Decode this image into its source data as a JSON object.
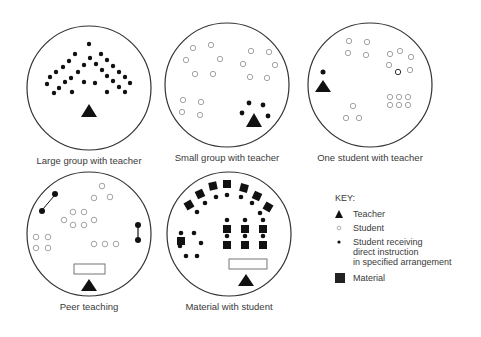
{
  "panels": [
    {
      "id": "large-group",
      "caption": "Large group with teacher"
    },
    {
      "id": "small-group",
      "caption": "Small group with teacher"
    },
    {
      "id": "one-student",
      "caption": "One student with teacher"
    },
    {
      "id": "peer-teaching",
      "caption": "Peer teaching"
    },
    {
      "id": "material",
      "caption": "Material with student"
    }
  ],
  "key": {
    "title": "KEY:",
    "items": [
      {
        "symbol": "triangle",
        "label": "Teacher"
      },
      {
        "symbol": "open-circle",
        "label": "Student"
      },
      {
        "symbol": "filled-dot",
        "label_lines": [
          "Student receiving",
          "direct instruction",
          "in specified arrangement"
        ]
      },
      {
        "symbol": "filled-square",
        "label": "Material"
      }
    ]
  },
  "colors": {
    "ink": "#111111",
    "open": "#9a9a9a",
    "ring": "#333333"
  }
}
